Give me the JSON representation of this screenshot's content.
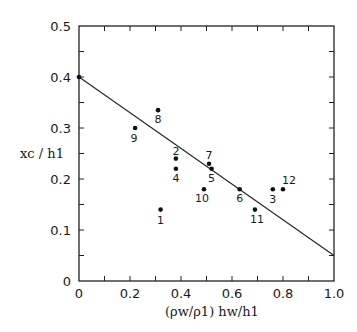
{
  "chart_data": {
    "type": "scatter",
    "title": "",
    "xlabel": "(ρw/ρ1) hw/h1",
    "ylabel": "xc / h1",
    "xlim": [
      0,
      1.0
    ],
    "ylim": [
      0,
      0.5
    ],
    "grid": false,
    "legend": null,
    "x_ticks": [
      "0",
      "0.2",
      "0.4",
      "0.6",
      "0.8",
      "1.0"
    ],
    "y_ticks": [
      "0",
      "0.1",
      "0.2",
      "0.3",
      "0.4",
      "0.5"
    ],
    "points": [
      {
        "label": "",
        "x": 0.0,
        "y": 0.4
      },
      {
        "label": "1",
        "x": 0.32,
        "y": 0.14
      },
      {
        "label": "2",
        "x": 0.38,
        "y": 0.24
      },
      {
        "label": "3",
        "x": 0.76,
        "y": 0.18
      },
      {
        "label": "4",
        "x": 0.38,
        "y": 0.22
      },
      {
        "label": "5",
        "x": 0.52,
        "y": 0.22
      },
      {
        "label": "6",
        "x": 0.63,
        "y": 0.18
      },
      {
        "label": "7",
        "x": 0.51,
        "y": 0.23
      },
      {
        "label": "8",
        "x": 0.31,
        "y": 0.335
      },
      {
        "label": "9",
        "x": 0.22,
        "y": 0.3
      },
      {
        "label": "10",
        "x": 0.49,
        "y": 0.18
      },
      {
        "label": "11",
        "x": 0.69,
        "y": 0.14
      },
      {
        "label": "12",
        "x": 0.8,
        "y": 0.18
      }
    ],
    "fit_line": {
      "x": [
        0,
        1.0
      ],
      "y": [
        0.4,
        0.05
      ]
    }
  }
}
